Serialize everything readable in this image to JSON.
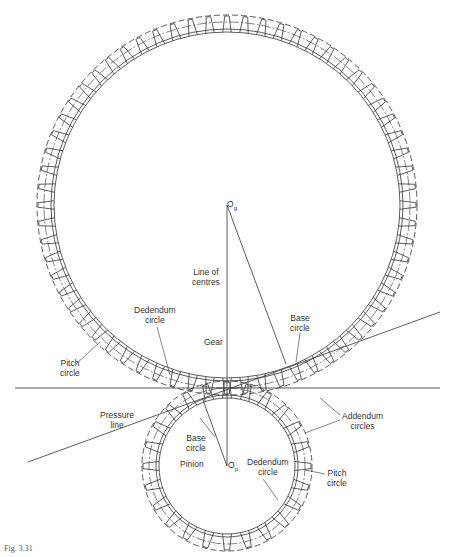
{
  "figure": {
    "caption": "Fig. 3.31"
  },
  "labels": {
    "gear_centre": "O",
    "gear_centre_sub": "g",
    "pinion_centre": "O",
    "pinion_centre_sub": "p",
    "line_of_centres": "Line of\ncentres",
    "gear": "Gear",
    "gear_dedendum_circle": "Dedendum\ncircle",
    "gear_pitch_circle": "Pitch\ncircle",
    "gear_base_circle": "Base\ncircle",
    "addendum_circles": "Addendum\ncircles",
    "pressure_line": "Pressure\nline",
    "pinion_base_circle": "Base\ncircle",
    "pinion": "Pinion",
    "pinion_dedendum_circle": "Dedendum\ncircle",
    "pinion_pitch_circle": "Pitch\ncircle"
  },
  "geometry": {
    "gear": {
      "cx": 227,
      "cy": 205,
      "pitch_r": 183,
      "base_r": 176,
      "dedendum_r": 173,
      "addendum_r": 190,
      "teeth": 64
    },
    "pinion": {
      "cx": 227,
      "cy": 466,
      "pitch_r": 78,
      "base_r": 71,
      "dedendum_r": 68,
      "addendum_r": 85,
      "teeth": 24
    },
    "pitch_point": {
      "x": 227,
      "y": 388
    },
    "tangent_line": {
      "x1": 15,
      "y1": 388,
      "x2": 440,
      "y2": 388
    },
    "pressure_line": {
      "x1": 28,
      "y1": 462,
      "x2": 440,
      "y2": 312
    },
    "stroke_color": "#333333"
  }
}
